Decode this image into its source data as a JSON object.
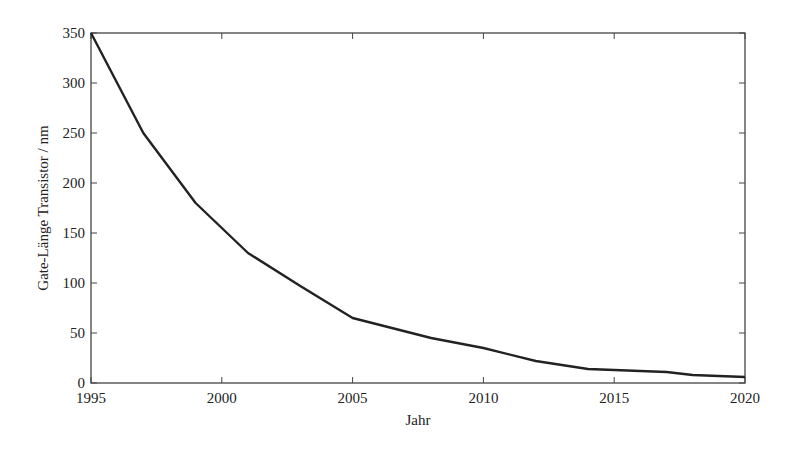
{
  "chart_data": {
    "type": "line",
    "title": "",
    "xlabel": "Jahr",
    "ylabel": "Gate-Länge Transistor / nm",
    "xlim": [
      1995,
      2020
    ],
    "ylim": [
      0,
      350
    ],
    "xticks": [
      1995,
      2000,
      2005,
      2010,
      2015,
      2020
    ],
    "yticks": [
      0,
      50,
      100,
      150,
      200,
      250,
      300,
      350
    ],
    "grid": false,
    "legend": null,
    "series": [
      {
        "name": "Gate-Länge",
        "color": "#222222",
        "x": [
          1995,
          1997,
          1999,
          2001,
          2003,
          2005,
          2008,
          2010,
          2012,
          2014,
          2017,
          2018,
          2020
        ],
        "y": [
          350,
          250,
          180,
          130,
          97,
          65,
          45,
          35,
          22,
          14,
          11,
          8,
          6
        ]
      }
    ]
  },
  "layout": {
    "plot": {
      "left": 91,
      "top": 33,
      "right": 745,
      "bottom": 383
    },
    "line_color": "#222222",
    "axis_color": "#444444"
  }
}
